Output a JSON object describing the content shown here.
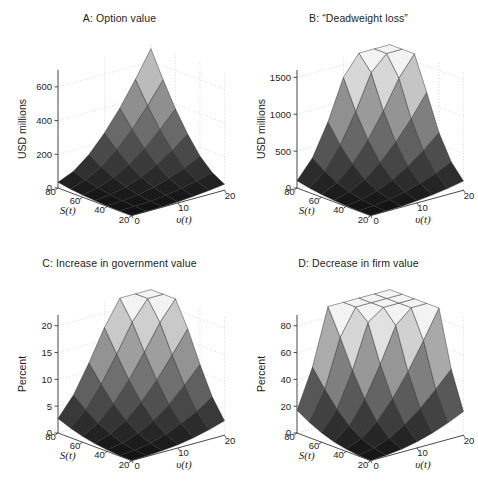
{
  "figure": {
    "width": 478,
    "height": 491,
    "background": "#ffffff",
    "layout": "2x2 grid of 3D surface plots",
    "shared_axes": {
      "x_label": "S(t)",
      "y_label": "υ(t)",
      "x_ticks": [
        "80",
        "60",
        "40",
        "20"
      ],
      "x_tick_values": [
        80,
        60,
        40,
        20
      ],
      "y_ticks": [
        "0",
        "10",
        "20"
      ],
      "y_tick_values": [
        0,
        10,
        20
      ],
      "x_range": [
        20,
        80
      ],
      "y_range": [
        0,
        20
      ],
      "grid": "dotted light gray"
    }
  },
  "panels": [
    {
      "id": "A",
      "title": "A: Option value",
      "zlabel": "USD millions",
      "z_ticks": [
        "0",
        "200",
        "400",
        "600"
      ],
      "z_tick_values": [
        0,
        200,
        400,
        600
      ],
      "zlim": [
        0,
        700
      ]
    },
    {
      "id": "B",
      "title": "B: “Deadweight loss”",
      "zlabel": "USD millions",
      "z_ticks": [
        "0",
        "500",
        "1000",
        "1500"
      ],
      "z_tick_values": [
        0,
        500,
        1000,
        1500
      ],
      "zlim": [
        0,
        1600
      ]
    },
    {
      "id": "C",
      "title": "C: Increase in government value",
      "zlabel": "Percent",
      "z_ticks": [
        "0",
        "5",
        "10",
        "15",
        "20"
      ],
      "z_tick_values": [
        0,
        5,
        10,
        15,
        20
      ],
      "zlim": [
        0,
        22
      ]
    },
    {
      "id": "D",
      "title": "D: Decrease in firm value",
      "zlabel": "Percent",
      "z_ticks": [
        "0",
        "20",
        "40",
        "60",
        "80"
      ],
      "z_tick_values": [
        0,
        20,
        40,
        60,
        80
      ],
      "zlim": [
        0,
        88
      ]
    }
  ],
  "chart_data": [
    {
      "type": "surface",
      "panel": "A",
      "title": "A: Option value",
      "xlabel": "S(t)",
      "ylabel": "υ(t)",
      "zlabel": "USD millions",
      "x": [
        20,
        30,
        40,
        50,
        60,
        70,
        80
      ],
      "y": [
        0,
        3.333,
        6.667,
        10,
        13.333,
        16.667,
        20
      ],
      "zlim": [
        0,
        700
      ],
      "colormap": "gray",
      "z": [
        [
          0,
          1,
          3,
          7,
          13,
          22,
          34
        ],
        [
          1,
          3,
          8,
          17,
          31,
          50,
          74
        ],
        [
          3,
          8,
          19,
          38,
          66,
          103,
          148
        ],
        [
          7,
          18,
          38,
          72,
          119,
          180,
          251
        ],
        [
          14,
          33,
          66,
          119,
          189,
          276,
          374
        ],
        [
          24,
          53,
          103,
          180,
          276,
          392,
          519
        ],
        [
          36,
          78,
          148,
          251,
          374,
          519,
          676
        ]
      ]
    },
    {
      "type": "surface",
      "panel": "B",
      "title": "B: “Deadweight loss”",
      "xlabel": "S(t)",
      "ylabel": "υ(t)",
      "zlabel": "USD millions",
      "x": [
        20,
        30,
        40,
        50,
        60,
        70,
        80
      ],
      "y": [
        0,
        3.333,
        6.667,
        10,
        13.333,
        16.667,
        20
      ],
      "zlim": [
        0,
        1600
      ],
      "colormap": "gray",
      "z": [
        [
          0,
          3,
          9,
          20,
          38,
          64,
          98
        ],
        [
          4,
          14,
          36,
          76,
          140,
          232,
          352
        ],
        [
          12,
          40,
          96,
          192,
          336,
          532,
          782
        ],
        [
          28,
          84,
          190,
          362,
          608,
          930,
          1328
        ],
        [
          52,
          146,
          316,
          580,
          942,
          1398,
          1944
        ],
        [
          84,
          226,
          472,
          840,
          1330,
          1930,
          2628
        ],
        [
          124,
          324,
          658,
          1142,
          1772,
          2528,
          3396
        ]
      ]
    },
    {
      "type": "surface",
      "panel": "C",
      "title": "C: Increase in government value",
      "xlabel": "S(t)",
      "ylabel": "υ(t)",
      "zlabel": "Percent",
      "x": [
        20,
        30,
        40,
        50,
        60,
        70,
        80
      ],
      "y": [
        0,
        3.333,
        6.667,
        10,
        13.333,
        16.667,
        20
      ],
      "zlim": [
        0,
        22
      ],
      "colormap": "gray",
      "z": [
        [
          0,
          0.1,
          0.3,
          0.6,
          1.1,
          1.8,
          2.7
        ],
        [
          0.1,
          0.3,
          0.8,
          1.6,
          2.8,
          4.4,
          6.3
        ],
        [
          0.3,
          0.8,
          1.8,
          3.4,
          5.6,
          8.4,
          11.5
        ],
        [
          0.6,
          1.7,
          3.4,
          6.0,
          9.3,
          13.2,
          17.3
        ],
        [
          1.1,
          2.9,
          5.6,
          9.3,
          13.7,
          18.4,
          22.8
        ],
        [
          1.8,
          4.4,
          8.4,
          13.2,
          18.4,
          23.5,
          28.2
        ],
        [
          2.7,
          6.3,
          11.5,
          17.3,
          22.8,
          28.2,
          33.0
        ]
      ]
    },
    {
      "type": "surface",
      "panel": "D",
      "title": "D: Decrease in firm value",
      "xlabel": "S(t)",
      "ylabel": "υ(t)",
      "zlabel": "Percent",
      "x": [
        20,
        30,
        40,
        50,
        60,
        70,
        80
      ],
      "y": [
        0,
        3.333,
        6.667,
        10,
        13.333,
        16.667,
        20
      ],
      "zlim": [
        0,
        88
      ],
      "colormap": "gray",
      "z": [
        [
          0,
          0.6,
          1.8,
          3.8,
          7.0,
          11.4,
          17.0
        ],
        [
          0.8,
          2.6,
          6.4,
          12.6,
          21.6,
          33.0,
          46.0
        ],
        [
          2.2,
          7.0,
          16.0,
          29.4,
          47.4,
          68.6,
          91.0
        ],
        [
          4.6,
          14.0,
          30.0,
          52.2,
          80.0,
          110.0,
          140.0
        ],
        [
          8.0,
          23.0,
          47.0,
          78.0,
          114.0,
          150.0,
          184.0
        ],
        [
          12.4,
          34.0,
          67.0,
          107.0,
          150.0,
          192.0,
          230.0
        ],
        [
          17.6,
          46.0,
          89.0,
          138.0,
          188.0,
          234.0,
          276.0
        ]
      ]
    }
  ]
}
